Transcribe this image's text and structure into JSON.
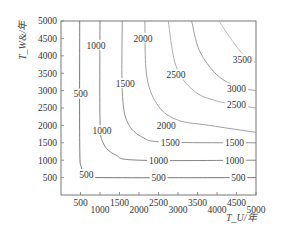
{
  "chart_data": {
    "type": "contour",
    "title": "",
    "xlabel": "T_U/年",
    "ylabel": "T_W&/年",
    "xlim": [
      0,
      5000
    ],
    "ylim": [
      0,
      5000
    ],
    "grid": false,
    "legend": null,
    "x_ticks": [
      500,
      1000,
      1500,
      2000,
      2500,
      3000,
      3500,
      4000,
      4500,
      5000
    ],
    "x_tick_labels": [
      "500",
      "1000",
      "1500",
      "2000",
      "2500",
      "3000",
      "3500",
      "4000",
      "4500",
      "5000"
    ],
    "y_ticks": [
      500,
      1000,
      1500,
      2000,
      2500,
      3000,
      3500,
      4000,
      4500,
      5000
    ],
    "y_tick_labels": [
      "500",
      "1000",
      "1500",
      "2000",
      "2500",
      "3000",
      "3500",
      "4000",
      "4500",
      "5000"
    ],
    "contour_levels": [
      500,
      1000,
      1500,
      2000,
      2500,
      3000,
      3500
    ],
    "contours": [
      {
        "level": 500,
        "points": [
          [
            480,
            5000
          ],
          [
            480,
            1500
          ],
          [
            520,
            800
          ],
          [
            700,
            560
          ],
          [
            1000,
            500
          ],
          [
            5000,
            500
          ]
        ],
        "labels": [
          {
            "text": "500",
            "x": 500,
            "y": 2900
          },
          {
            "text": "500",
            "x": 650,
            "y": 580
          },
          {
            "text": "500",
            "x": 2500,
            "y": 500
          },
          {
            "text": "500",
            "x": 4550,
            "y": 500
          }
        ]
      },
      {
        "level": 1000,
        "points": [
          [
            1000,
            5000
          ],
          [
            1000,
            2200
          ],
          [
            1080,
            1500
          ],
          [
            1400,
            1150
          ],
          [
            2000,
            1000
          ],
          [
            5000,
            1000
          ]
        ],
        "labels": [
          {
            "text": "1000",
            "x": 900,
            "y": 4300
          },
          {
            "text": "1000",
            "x": 1050,
            "y": 1850
          },
          {
            "text": "1000",
            "x": 2500,
            "y": 1000
          },
          {
            "text": "1000",
            "x": 4450,
            "y": 1000
          }
        ]
      },
      {
        "level": 1500,
        "points": [
          [
            1570,
            5000
          ],
          [
            1570,
            3000
          ],
          [
            1700,
            2100
          ],
          [
            2100,
            1650
          ],
          [
            2700,
            1520
          ],
          [
            5000,
            1500
          ]
        ],
        "labels": [
          {
            "text": "1500",
            "x": 1650,
            "y": 3200
          },
          {
            "text": "1500",
            "x": 2800,
            "y": 1500
          },
          {
            "text": "1500",
            "x": 4450,
            "y": 1500
          }
        ]
      },
      {
        "level": 2000,
        "points": [
          [
            2150,
            5000
          ],
          [
            2200,
            3400
          ],
          [
            2500,
            2550
          ],
          [
            3000,
            2150
          ],
          [
            3800,
            2000
          ],
          [
            5000,
            1800
          ]
        ],
        "labels": [
          {
            "text": "2000",
            "x": 2100,
            "y": 4500
          },
          {
            "text": "2000",
            "x": 2700,
            "y": 2000
          }
        ]
      },
      {
        "level": 2500,
        "points": [
          [
            2750,
            5000
          ],
          [
            2950,
            3700
          ],
          [
            3400,
            3000
          ],
          [
            4000,
            2700
          ],
          [
            5000,
            2500
          ]
        ],
        "labels": [
          {
            "text": "2500",
            "x": 2950,
            "y": 3450
          },
          {
            "text": "2500",
            "x": 4500,
            "y": 2600
          }
        ]
      },
      {
        "level": 3000,
        "points": [
          [
            3350,
            5000
          ],
          [
            3550,
            4150
          ],
          [
            4000,
            3450
          ],
          [
            4550,
            3100
          ],
          [
            5000,
            3000
          ]
        ],
        "labels": [
          {
            "text": "3000",
            "x": 4500,
            "y": 3050
          }
        ]
      },
      {
        "level": 3500,
        "points": [
          [
            4050,
            5000
          ],
          [
            4350,
            4500
          ],
          [
            4700,
            4000
          ],
          [
            5000,
            3800
          ]
        ],
        "labels": [
          {
            "text": "3500",
            "x": 4650,
            "y": 3900
          }
        ]
      }
    ]
  }
}
